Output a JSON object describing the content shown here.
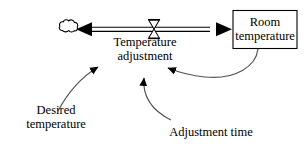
{
  "diagram": {
    "type": "stock-and-flow",
    "background_color": "#ffffff",
    "line_color": "#000000",
    "stock": {
      "label": "Room\ntemperature",
      "shape": "rectangle"
    },
    "flow": {
      "label": "Temperature\nadjustment",
      "valve_icon": "valve-bowtie-icon",
      "source_icon": "cloud-icon",
      "direction": "bidirectional"
    },
    "variables": [
      {
        "name": "desired-temperature",
        "label": "Desired\ntemperature"
      },
      {
        "name": "adjustment-time",
        "label": "Adjustment time"
      }
    ],
    "links": [
      {
        "name": "link-desired-to-flow",
        "from": "Desired temperature",
        "to": "Temperature adjustment"
      },
      {
        "name": "link-adjustment-time-to-flow",
        "from": "Adjustment time",
        "to": "Temperature adjustment"
      },
      {
        "name": "link-room-temperature-to-flow",
        "from": "Room temperature",
        "to": "Temperature adjustment"
      }
    ]
  }
}
